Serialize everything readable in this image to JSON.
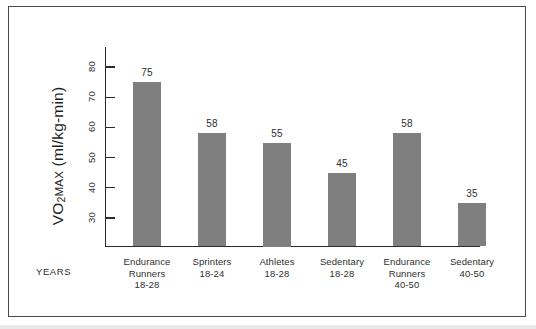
{
  "chart_data": {
    "type": "bar",
    "title": "",
    "xlabel": "YEARS",
    "ylabel": "VO2MAX (ml/kg-min)",
    "ylabel_parts": {
      "main": "VO",
      "sub": "2",
      "smallcaps": "MAX",
      "units": " (ml/kg-min)"
    },
    "categories": [
      "Endurance\nRunners\n18-28",
      "Sprinters\n18-24",
      "Athletes\n18-28",
      "Sedentary\n18-28",
      "Endurance\nRunners\n40-50",
      "Sedentary\n40-50"
    ],
    "category_lines": [
      [
        "Endurance",
        "Runners",
        "18-28"
      ],
      [
        "Sprinters",
        "18-24"
      ],
      [
        "Athletes",
        "18-28"
      ],
      [
        "Sedentary",
        "18-28"
      ],
      [
        "Endurance",
        "Runners",
        "40-50"
      ],
      [
        "Sedentary",
        "40-50"
      ]
    ],
    "values": [
      75,
      58,
      55,
      45,
      58,
      35
    ],
    "value_labels": [
      "75",
      "58",
      "55",
      "45",
      "58",
      "35"
    ],
    "yticks": [
      30,
      40,
      50,
      60,
      70,
      80
    ],
    "ytick_labels": [
      "30",
      "40",
      "50",
      "60",
      "70",
      "80"
    ],
    "ylim": [
      23,
      85
    ],
    "grid": false,
    "legend": null,
    "bar_color": "#7f7f7f",
    "axis_color": "#2b2b2b",
    "text_color": "#2f2f2f",
    "background": "#ffffff",
    "frame_color": "#4a4a4a"
  }
}
